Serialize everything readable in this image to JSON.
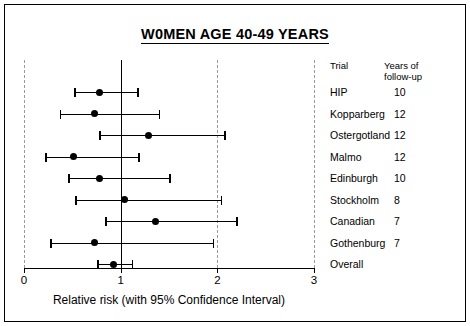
{
  "title": "W0MEN AGE 40-49 YEARS",
  "legend": {
    "header_trial": "Trial",
    "header_years_line1": "Years of",
    "header_years_line2": "follow-up"
  },
  "chart_data": {
    "type": "scatter",
    "title": "W0MEN AGE 40-49 YEARS",
    "xlabel": "Relative risk (with 95% Confidence Interval)",
    "ylabel": "",
    "xlim": [
      0,
      3
    ],
    "xticks": [
      0,
      1,
      2,
      3
    ],
    "xticklabels": [
      "0",
      "1",
      "2",
      "3"
    ],
    "gridlines": [
      0,
      1,
      2,
      3
    ],
    "reference_line": 1,
    "grid": true,
    "legend_position": "right",
    "columns": [
      "Trial",
      "Years of follow-up",
      "Relative risk",
      "CI lower",
      "CI upper"
    ],
    "rows": [
      {
        "trial": "HIP",
        "years": "10",
        "rr": 0.78,
        "lower": 0.52,
        "upper": 1.19
      },
      {
        "trial": "Kopparberg",
        "years": "12",
        "rr": 0.73,
        "lower": 0.37,
        "upper": 1.41
      },
      {
        "trial": "Ostergotland",
        "years": "12",
        "rr": 1.29,
        "lower": 0.78,
        "upper": 2.09
      },
      {
        "trial": "Malmo",
        "years": "12",
        "rr": 0.51,
        "lower": 0.22,
        "upper": 1.2
      },
      {
        "trial": "Edinburgh",
        "years": "10",
        "rr": 0.78,
        "lower": 0.46,
        "upper": 1.52
      },
      {
        "trial": "Stockholm",
        "years": "8",
        "rr": 1.04,
        "lower": 0.53,
        "upper": 2.05
      },
      {
        "trial": "Canadian",
        "years": "7",
        "rr": 1.36,
        "lower": 0.84,
        "upper": 2.21
      },
      {
        "trial": "Gothenburg",
        "years": "7",
        "rr": 0.73,
        "lower": 0.27,
        "upper": 1.97
      },
      {
        "trial": "Overall",
        "years": "",
        "rr": 0.93,
        "lower": 0.76,
        "upper": 1.13
      }
    ]
  }
}
